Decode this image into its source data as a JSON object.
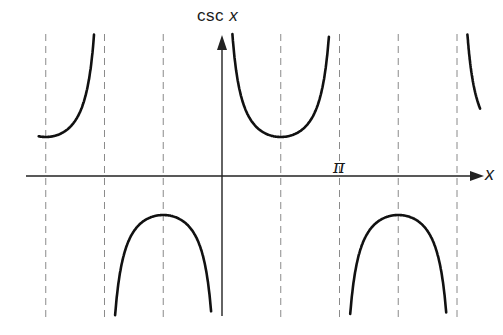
{
  "chart_data": {
    "type": "line",
    "title": "",
    "function": "csc x",
    "xlabel": "x",
    "ylabel": "csc x",
    "x_tick_labels": [
      {
        "value": 3.14159,
        "label": "π"
      }
    ],
    "asymptotes_dashed": [
      -4.712,
      -3.1416,
      -1.5708,
      1.5708,
      3.1416,
      4.712,
      6.2832
    ],
    "series": [
      {
        "name": "csc x, branch (-π, 0)·left tail",
        "x_range": [
          -4.9,
          -3.2
        ],
        "extreme": {
          "x": -4.712,
          "y": 1
        }
      },
      {
        "name": "csc x, branch (-π, 0)",
        "x_range": [
          -3.0,
          -0.15
        ],
        "extreme": {
          "x": -1.5708,
          "y": -1
        }
      },
      {
        "name": "csc x, branch (0, π)",
        "x_range": [
          0.15,
          3.0
        ],
        "extreme": {
          "x": 1.5708,
          "y": 1
        }
      },
      {
        "name": "csc x, branch (π, 2π)",
        "x_range": [
          3.3,
          6.15
        ],
        "extreme": {
          "x": 4.712,
          "y": -1
        }
      },
      {
        "name": "csc x, branch (2π, 3π) start",
        "x_range": [
          6.45,
          6.9
        ]
      }
    ],
    "xlim": [
      -5.3,
      6.8
    ],
    "ylim": [
      -3.6,
      3.6
    ],
    "grid": false,
    "legend": null
  },
  "labels": {
    "y_axis_prefix": "csc ",
    "y_axis_var": "x",
    "x_axis": "x",
    "pi": "π"
  }
}
